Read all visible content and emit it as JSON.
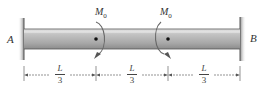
{
  "diagram": {
    "type": "fixed-fixed beam with two applied couple moments",
    "supports": [
      {
        "label": "A",
        "side": "left",
        "type": "fixed wall"
      },
      {
        "label": "B",
        "side": "right",
        "type": "fixed wall"
      }
    ],
    "moments": [
      {
        "label": "M",
        "subscript": "0",
        "position": "L/3 from A",
        "direction": "clockwise"
      },
      {
        "label": "M",
        "subscript": "0",
        "position": "2L/3 from A",
        "direction": "clockwise"
      }
    ],
    "dimensions": [
      {
        "numerator": "L",
        "denominator": "3"
      },
      {
        "numerator": "L",
        "denominator": "3"
      },
      {
        "numerator": "L",
        "denominator": "3"
      }
    ],
    "colors": {
      "beam_fill": "#b8b8b8",
      "beam_edge": "#555555",
      "wall": "#7a7a7a",
      "text": "#333333"
    }
  }
}
